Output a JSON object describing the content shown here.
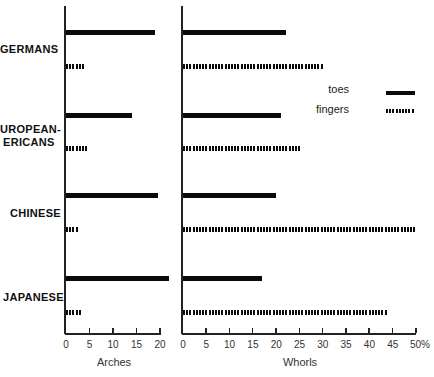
{
  "chart_data": [
    {
      "type": "bar",
      "orientation": "horizontal",
      "title": "",
      "xlabel": "Arches",
      "ylabel": "",
      "xlim": [
        0,
        20
      ],
      "x_ticks": [
        "0",
        "5",
        "10",
        "15",
        "20"
      ],
      "categories": [
        "GERMANS",
        "EUROPEAN-AMERICANS",
        "CHINESE",
        "JAPANESE"
      ],
      "series": [
        {
          "name": "toes",
          "style": "solid",
          "values": [
            19,
            14,
            19.5,
            22
          ]
        },
        {
          "name": "fingers",
          "style": "dotted",
          "values": [
            4,
            4.5,
            2.5,
            3.5
          ]
        }
      ],
      "grid": false
    },
    {
      "type": "bar",
      "orientation": "horizontal",
      "title": "",
      "xlabel": "Whorls",
      "ylabel": "",
      "xlim": [
        0,
        50
      ],
      "x_ticks": [
        "0",
        "5",
        "10",
        "15",
        "20",
        "25",
        "30",
        "35",
        "40",
        "45",
        "50%"
      ],
      "categories": [
        "GERMANS",
        "EUROPEAN-AMERICANS",
        "CHINESE",
        "JAPANESE"
      ],
      "series": [
        {
          "name": "toes",
          "style": "solid",
          "values": [
            22,
            21,
            20,
            17
          ]
        },
        {
          "name": "fingers",
          "style": "dotted",
          "values": [
            30,
            25,
            50,
            44
          ]
        }
      ],
      "grid": false,
      "legend": {
        "position": "right",
        "entries": [
          "toes",
          "fingers"
        ]
      }
    }
  ],
  "labels": {
    "groups": [
      {
        "line1": "GERMANS",
        "line2": ""
      },
      {
        "line1": "UROPEAN-",
        "line2": "ERICANS"
      },
      {
        "line1": "CHINESE",
        "line2": ""
      },
      {
        "line1": "JAPANESE",
        "line2": ""
      }
    ],
    "arches_title": "Arches",
    "whorls_title": "Whorls",
    "arches_ticks": [
      "0",
      "5",
      "10",
      "15",
      "20"
    ],
    "whorls_ticks": [
      "0",
      "5",
      "10",
      "15",
      "20",
      "25",
      "30",
      "35",
      "40",
      "45",
      "50%"
    ],
    "legend_toes": "toes",
    "legend_fingers": "fingers"
  }
}
